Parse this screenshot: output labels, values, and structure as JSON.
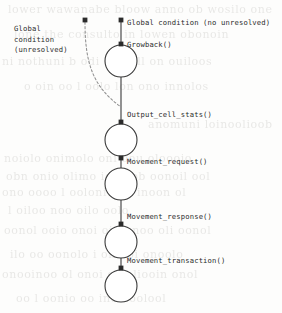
{
  "diagram": {
    "type": "state-sequence-flow",
    "title": "",
    "background_color": "#fdfdfc",
    "stroke_color": "#3a3a3a",
    "node_fill": "#ffffff",
    "dashed_color": "#8a8a8a",
    "labels": {
      "global_condition_unresolved": "Global\ncondition\n(unresolved)",
      "global_condition_unresolved_lines": [
        "Global",
        "condition",
        "(unresolved)"
      ],
      "global_condition_no_unresolved": "Global condition (no unresolved)",
      "growback": "Growback()",
      "output_cell_stats": "Output_cell_stats()",
      "movement_request": "Movement_request()",
      "movement_response": "Movement_response()",
      "movement_transaction": "Movement_transaction()"
    },
    "nodes": [
      {
        "id": "n1",
        "cx": 121,
        "cy": 61,
        "r": 16
      },
      {
        "id": "n2",
        "cx": 121,
        "cy": 140,
        "r": 16
      },
      {
        "id": "n3",
        "cx": 121,
        "cy": 184,
        "r": 16
      },
      {
        "id": "n4",
        "cx": 121,
        "cy": 242,
        "r": 16
      },
      {
        "id": "n5",
        "cx": 121,
        "cy": 286,
        "r": 16
      }
    ],
    "transition_dots": [
      {
        "id": "d_top",
        "x": 121,
        "y": 20
      },
      {
        "id": "d_growback",
        "x": 121,
        "y": 44
      },
      {
        "id": "d_output",
        "x": 121,
        "y": 122
      },
      {
        "id": "d_mv_request",
        "x": 121,
        "y": 158
      },
      {
        "id": "d_mv_response",
        "x": 121,
        "y": 224
      },
      {
        "id": "d_mv_trans",
        "x": 121,
        "y": 268
      },
      {
        "id": "d_dashed_start",
        "x": 85,
        "y": 20
      }
    ],
    "dashed_edge": {
      "from": {
        "x": 85,
        "y": 20
      },
      "to": {
        "x": 121,
        "y": 107
      },
      "style": "dashed-curve",
      "label_ref": "global_condition_unresolved"
    }
  },
  "bleed_text": {
    "note": "faint show-through text from reverse of scanned page",
    "lines": [
      {
        "text": "lower  wawanabe  bloow  anno  ob  wosilo one",
        "x": 8,
        "y": 3
      },
      {
        "text": "lone  the  consulto  in  lowen  obonoin",
        "x": 14,
        "y": 28
      },
      {
        "text": "ni  nothuni  b  odi  of  woll  on  ouiloos",
        "x": 2,
        "y": 55
      },
      {
        "text": "o  oin  oo  l  oolo  lon  ono  innolos",
        "x": 24,
        "y": 80
      },
      {
        "text": "anomuni  loinoolioob",
        "x": 148,
        "y": 118
      },
      {
        "text": "noiolo  onimolo  oni  oou  oloooio",
        "x": 4,
        "y": 152
      },
      {
        "text": "obn  onio  olimo  ioon  ob  oonoil  ool",
        "x": 6,
        "y": 170
      },
      {
        "text": "ono  oooo  l  oolonio  oo  inoon  ol",
        "x": 2,
        "y": 186
      },
      {
        "text": "l  oiloo  noo  oilo  oolo",
        "x": 8,
        "y": 204
      },
      {
        "text": "oonol  ooio  onoi  oin  onoo  oli  oonol",
        "x": 4,
        "y": 224
      },
      {
        "text": "ilo  oo  oonolo  i  ono  oi  onoolo",
        "x": 10,
        "y": 248
      },
      {
        "text": "onooinoo  ol  onoi  oo  oliooin  onol",
        "x": 2,
        "y": 268
      },
      {
        "text": "oo  l  oonio  oo  inoo  oolool",
        "x": 16,
        "y": 292
      }
    ]
  }
}
